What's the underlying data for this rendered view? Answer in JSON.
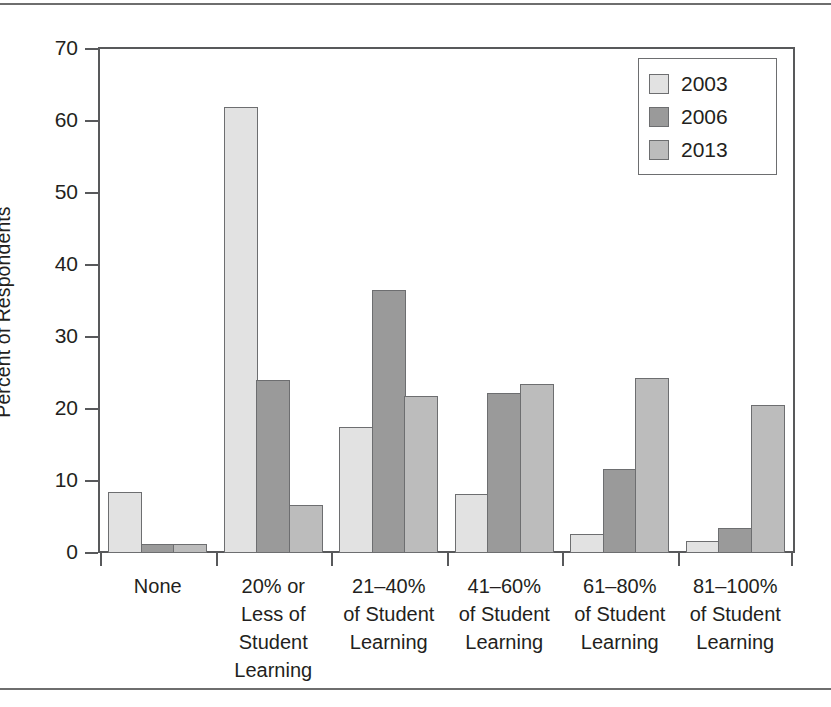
{
  "chart_data": {
    "type": "bar",
    "title": "",
    "subtitle": "",
    "xlabel": "",
    "ylabel": "Percent of Respondents",
    "ylim": [
      0,
      70
    ],
    "yticks": [
      0,
      10,
      20,
      30,
      40,
      50,
      60,
      70
    ],
    "ytick_labels": [
      "0",
      "10",
      "20",
      "30",
      "40",
      "50",
      "60",
      "70"
    ],
    "grid": false,
    "legend_position": "top-right",
    "categories": [
      "None",
      "20% or Less of Student Learning",
      "21–40% of Student Learning",
      "41–60% of Student Learning",
      "61–80% of Student Learning",
      "81–100% of Student Learning"
    ],
    "category_label_lines": [
      [
        "None"
      ],
      [
        "20% or",
        "Less of",
        "Student",
        "Learning"
      ],
      [
        "21–40%",
        "of Student",
        "Learning"
      ],
      [
        "41–60%",
        "of Student",
        "Learning"
      ],
      [
        "61–80%",
        "of Student",
        "Learning"
      ],
      [
        "81–100%",
        "of Student",
        "Learning"
      ]
    ],
    "series": [
      {
        "name": "2003",
        "color": "#e2e2e2",
        "values": [
          8.5,
          62.0,
          17.5,
          8.2,
          2.6,
          1.6
        ]
      },
      {
        "name": "2006",
        "color": "#9a9a9a",
        "values": [
          1.3,
          24.0,
          36.5,
          22.2,
          11.6,
          3.5
        ]
      },
      {
        "name": "2013",
        "color": "#bcbcbc",
        "values": [
          1.3,
          6.7,
          21.8,
          23.5,
          24.3,
          20.5
        ]
      }
    ]
  },
  "legend": {
    "entries": [
      {
        "label": "2003",
        "swatch": "s2003"
      },
      {
        "label": "2006",
        "swatch": "s2006"
      },
      {
        "label": "2013",
        "swatch": "s2013"
      }
    ]
  }
}
